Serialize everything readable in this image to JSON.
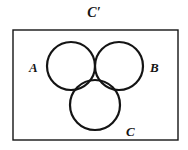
{
  "figure": {
    "kind": "venn-diagram",
    "width": 188,
    "height": 150,
    "background_color": "#ffffff",
    "stroke_color": "#141414",
    "universe_box": {
      "label": "C′",
      "x": 13,
      "y": 30,
      "width": 165,
      "height": 110,
      "stroke_width": 1.4
    },
    "circles": [
      {
        "label": "A",
        "cx": 71,
        "cy": 66,
        "r": 24,
        "stroke_width": 2.2,
        "fill": "none"
      },
      {
        "label": "B",
        "cx": 119,
        "cy": 66,
        "r": 24,
        "stroke_width": 2.2,
        "fill": "none"
      },
      {
        "label": "C",
        "cx": 95,
        "cy": 105,
        "r": 25,
        "stroke_width": 2.2,
        "fill": "none"
      }
    ],
    "labels": {
      "universe": "C′",
      "set_a": "A",
      "set_b": "B",
      "set_c": "C"
    }
  },
  "chart_data": {
    "type": "diagram",
    "title": "C′",
    "sets": [
      "A",
      "B",
      "C"
    ],
    "universe_label": "C′"
  }
}
